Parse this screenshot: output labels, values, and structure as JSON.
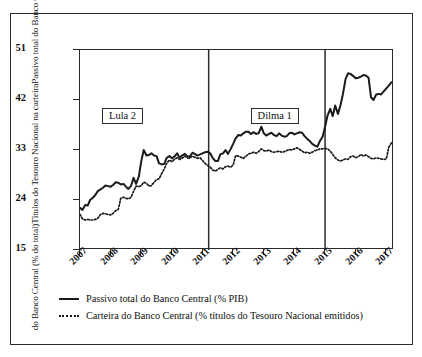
{
  "chart_data": {
    "type": "line",
    "title": "",
    "xlabel": "",
    "ylabel_lines": [
      "Passivo total do Banco Central (% do PIB),",
      "Títulos do Tesouro Nacional na carteira",
      "do Banco Central (% do total)"
    ],
    "xlim": [
      2007.0,
      2017.25
    ],
    "ylim": [
      15,
      51
    ],
    "yticks": [
      15,
      24,
      33,
      42,
      51
    ],
    "xticks": [
      "2007",
      "2008",
      "2009",
      "2010",
      "2011",
      "2012",
      "2013",
      "2014",
      "2015",
      "2016",
      "2017"
    ],
    "grid": false,
    "legend_position": "below-axes-left",
    "annotations": [
      {
        "label": "Lula 2",
        "x": 2007.75,
        "y": 39.0
      },
      {
        "label": "Dilma 1",
        "x": 2012.6,
        "y": 39.0
      }
    ],
    "vlines": [
      {
        "x": 2011.2,
        "label": ""
      },
      {
        "x": 2015.0,
        "label": ""
      }
    ],
    "series": [
      {
        "name": "Passivo total do Banco Central (% PIB)",
        "style": "solid",
        "color": "#1a1a1a",
        "x": [
          2007.0,
          2007.08,
          2007.17,
          2007.25,
          2007.33,
          2007.42,
          2007.5,
          2007.58,
          2007.67,
          2007.75,
          2007.83,
          2007.92,
          2008.0,
          2008.08,
          2008.17,
          2008.25,
          2008.33,
          2008.42,
          2008.5,
          2008.58,
          2008.67,
          2008.75,
          2008.83,
          2008.92,
          2009.0,
          2009.08,
          2009.17,
          2009.25,
          2009.33,
          2009.42,
          2009.5,
          2009.58,
          2009.67,
          2009.75,
          2009.83,
          2009.92,
          2010.0,
          2010.08,
          2010.17,
          2010.25,
          2010.33,
          2010.42,
          2010.5,
          2010.58,
          2010.67,
          2010.75,
          2010.83,
          2010.92,
          2011.0,
          2011.08,
          2011.17,
          2011.25,
          2011.33,
          2011.42,
          2011.5,
          2011.58,
          2011.67,
          2011.75,
          2011.83,
          2011.92,
          2012.0,
          2012.08,
          2012.17,
          2012.25,
          2012.33,
          2012.42,
          2012.5,
          2012.58,
          2012.67,
          2012.75,
          2012.83,
          2012.92,
          2013.0,
          2013.08,
          2013.17,
          2013.25,
          2013.33,
          2013.42,
          2013.5,
          2013.58,
          2013.67,
          2013.75,
          2013.83,
          2013.92,
          2014.0,
          2014.08,
          2014.17,
          2014.25,
          2014.33,
          2014.42,
          2014.5,
          2014.58,
          2014.67,
          2014.75,
          2014.83,
          2014.92,
          2015.0,
          2015.08,
          2015.17,
          2015.25,
          2015.33,
          2015.42,
          2015.5,
          2015.58,
          2015.67,
          2015.75,
          2015.83,
          2015.92,
          2016.0,
          2016.08,
          2016.17,
          2016.25,
          2016.33,
          2016.42,
          2016.5,
          2016.58,
          2016.67,
          2016.75,
          2016.83,
          2016.92,
          2017.0,
          2017.08,
          2017.17
        ],
        "values": [
          22.6,
          22.2,
          23.1,
          23.0,
          24.0,
          24.4,
          24.9,
          25.6,
          25.9,
          26.2,
          26.6,
          26.5,
          26.4,
          26.7,
          27.2,
          27.1,
          26.8,
          26.9,
          26.4,
          26.0,
          26.6,
          28.0,
          26.9,
          28.2,
          31.0,
          33.0,
          32.0,
          32.1,
          32.4,
          32.0,
          31.9,
          30.6,
          30.4,
          30.5,
          31.6,
          31.9,
          31.5,
          31.8,
          32.4,
          31.6,
          32.0,
          32.3,
          31.9,
          31.8,
          32.5,
          32.3,
          32.0,
          32.2,
          32.4,
          32.6,
          32.7,
          32.4,
          31.6,
          31.0,
          31.0,
          32.2,
          32.4,
          33.0,
          32.3,
          33.2,
          34.1,
          35.1,
          35.7,
          35.6,
          36.0,
          36.3,
          36.3,
          35.9,
          36.2,
          35.9,
          36.0,
          37.2,
          36.0,
          35.6,
          35.9,
          36.1,
          35.7,
          35.5,
          36.0,
          35.6,
          35.4,
          35.5,
          36.0,
          36.1,
          35.8,
          36.0,
          36.2,
          36.1,
          35.5,
          35.0,
          34.6,
          34.1,
          33.8,
          33.6,
          34.6,
          35.4,
          37.2,
          39.2,
          40.4,
          39.1,
          41.0,
          39.5,
          41.0,
          43.0,
          45.8,
          46.8,
          46.7,
          46.3,
          45.9,
          46.0,
          46.2,
          46.5,
          46.4,
          46.0,
          42.5,
          42.0,
          43.0,
          43.1,
          43.0,
          43.6,
          44.1,
          44.6,
          45.2
        ]
      },
      {
        "name": "Carteira do Banco Central (% títulos do Tesouro Nacional emitidos)",
        "style": "dotted",
        "color": "#1a1a1a",
        "x": [
          2007.0,
          2007.08,
          2007.17,
          2007.25,
          2007.33,
          2007.42,
          2007.5,
          2007.58,
          2007.67,
          2007.75,
          2007.83,
          2007.92,
          2008.0,
          2008.08,
          2008.17,
          2008.25,
          2008.33,
          2008.42,
          2008.5,
          2008.58,
          2008.67,
          2008.75,
          2008.83,
          2008.92,
          2009.0,
          2009.08,
          2009.17,
          2009.25,
          2009.33,
          2009.42,
          2009.5,
          2009.58,
          2009.67,
          2009.75,
          2009.83,
          2009.92,
          2010.0,
          2010.08,
          2010.17,
          2010.25,
          2010.33,
          2010.42,
          2010.5,
          2010.58,
          2010.67,
          2010.75,
          2010.83,
          2010.92,
          2011.0,
          2011.08,
          2011.17,
          2011.25,
          2011.33,
          2011.42,
          2011.5,
          2011.58,
          2011.67,
          2011.75,
          2011.83,
          2011.92,
          2012.0,
          2012.08,
          2012.17,
          2012.25,
          2012.33,
          2012.42,
          2012.5,
          2012.58,
          2012.67,
          2012.75,
          2012.83,
          2012.92,
          2013.0,
          2013.08,
          2013.17,
          2013.25,
          2013.33,
          2013.42,
          2013.5,
          2013.58,
          2013.67,
          2013.75,
          2013.83,
          2013.92,
          2014.0,
          2014.08,
          2014.17,
          2014.25,
          2014.33,
          2014.42,
          2014.5,
          2014.58,
          2014.67,
          2014.75,
          2014.83,
          2014.92,
          2015.0,
          2015.08,
          2015.17,
          2015.25,
          2015.33,
          2015.42,
          2015.5,
          2015.58,
          2015.67,
          2015.75,
          2015.83,
          2015.92,
          2016.0,
          2016.08,
          2016.17,
          2016.25,
          2016.33,
          2016.42,
          2016.5,
          2016.58,
          2016.67,
          2016.75,
          2016.83,
          2016.92,
          2017.0,
          2017.08,
          2017.17
        ],
        "values": [
          21.4,
          20.6,
          20.4,
          20.5,
          20.4,
          20.4,
          20.5,
          20.7,
          21.4,
          21.6,
          21.5,
          21.4,
          21.3,
          21.6,
          22.1,
          22.3,
          24.3,
          24.5,
          24.3,
          24.2,
          24.5,
          25.6,
          26.5,
          26.4,
          26.6,
          27.2,
          27.0,
          26.5,
          26.6,
          27.2,
          27.7,
          27.8,
          28.8,
          29.6,
          30.6,
          31.2,
          30.9,
          31.3,
          31.6,
          31.3,
          31.5,
          31.9,
          31.6,
          31.5,
          31.9,
          31.7,
          31.5,
          31.6,
          31.1,
          30.6,
          30.2,
          29.9,
          29.4,
          29.2,
          29.5,
          29.8,
          29.6,
          30.0,
          30.1,
          29.9,
          30.3,
          32.0,
          31.9,
          31.7,
          31.5,
          31.9,
          32.3,
          32.4,
          32.6,
          32.4,
          32.7,
          33.2,
          32.9,
          32.8,
          33.0,
          32.7,
          32.6,
          32.7,
          32.8,
          32.6,
          32.7,
          32.9,
          33.1,
          33.0,
          33.2,
          33.4,
          33.1,
          32.8,
          32.5,
          32.6,
          32.4,
          32.6,
          32.9,
          33.0,
          33.2,
          33.2,
          33.3,
          33.2,
          32.8,
          32.2,
          31.6,
          31.2,
          31.0,
          31.2,
          31.4,
          31.3,
          31.8,
          31.9,
          31.6,
          31.8,
          32.2,
          31.9,
          32.1,
          31.8,
          31.5,
          31.4,
          31.6,
          31.5,
          31.4,
          31.3,
          31.4,
          33.5,
          34.3
        ]
      }
    ]
  },
  "legend": {
    "items": [
      {
        "label": "Passivo total do Banco Central (% PIB)",
        "style": "solid"
      },
      {
        "label": "Carteira do Banco Central (% títulos do Tesouro Nacional emitidos)",
        "style": "dotted"
      }
    ]
  }
}
